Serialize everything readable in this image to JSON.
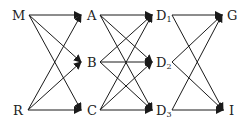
{
  "diagram": {
    "type": "directed-graph",
    "line_color": "#1a1a1a",
    "nodes": [
      {
        "id": "M",
        "label": "M",
        "sub": "",
        "x": 12,
        "y": 9
      },
      {
        "id": "R",
        "label": "R",
        "sub": "",
        "x": 13,
        "y": 104
      },
      {
        "id": "A",
        "label": "A",
        "sub": "",
        "x": 87,
        "y": 9
      },
      {
        "id": "B",
        "label": "B",
        "sub": "",
        "x": 87,
        "y": 56
      },
      {
        "id": "C",
        "label": "C",
        "sub": "",
        "x": 87,
        "y": 104
      },
      {
        "id": "D1",
        "label": "D",
        "sub": "1",
        "x": 156,
        "y": 9
      },
      {
        "id": "D2",
        "label": "D",
        "sub": "2",
        "x": 156,
        "y": 56
      },
      {
        "id": "D3",
        "label": "D",
        "sub": "3",
        "x": 156,
        "y": 104
      },
      {
        "id": "G",
        "label": "G",
        "sub": "",
        "x": 227,
        "y": 9
      },
      {
        "id": "I",
        "label": "I",
        "sub": "",
        "x": 229,
        "y": 104
      }
    ],
    "edges": [
      {
        "from": "M",
        "to": "A"
      },
      {
        "from": "M",
        "to": "B"
      },
      {
        "from": "M",
        "to": "C"
      },
      {
        "from": "R",
        "to": "A"
      },
      {
        "from": "R",
        "to": "B"
      },
      {
        "from": "R",
        "to": "C"
      },
      {
        "from": "A",
        "to": "D1"
      },
      {
        "from": "A",
        "to": "D2"
      },
      {
        "from": "A",
        "to": "D3"
      },
      {
        "from": "B",
        "to": "D1"
      },
      {
        "from": "B",
        "to": "D2"
      },
      {
        "from": "B",
        "to": "D3"
      },
      {
        "from": "C",
        "to": "D1"
      },
      {
        "from": "C",
        "to": "D2"
      },
      {
        "from": "C",
        "to": "D3"
      },
      {
        "from": "D1",
        "to": "G"
      },
      {
        "from": "D1",
        "to": "I"
      },
      {
        "from": "D2",
        "to": "G"
      },
      {
        "from": "D2",
        "to": "I"
      },
      {
        "from": "D3",
        "to": "G"
      },
      {
        "from": "D3",
        "to": "I"
      }
    ]
  }
}
